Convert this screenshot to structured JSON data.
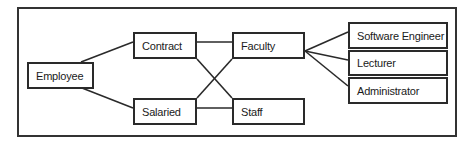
{
  "diagram": {
    "type": "hierarchy",
    "nodes": [
      {
        "id": "employee",
        "label": "Employee",
        "x": 27,
        "y": 62,
        "w": 67,
        "h": 27
      },
      {
        "id": "contract",
        "label": "Contract",
        "x": 133,
        "y": 32,
        "w": 64,
        "h": 27
      },
      {
        "id": "salaried",
        "label": "Salaried",
        "x": 133,
        "y": 98,
        "w": 64,
        "h": 27
      },
      {
        "id": "faculty",
        "label": "Faculty",
        "x": 232,
        "y": 32,
        "w": 73,
        "h": 27
      },
      {
        "id": "staff",
        "label": "Staff",
        "x": 232,
        "y": 98,
        "w": 73,
        "h": 27
      },
      {
        "id": "software_engineer",
        "label": "Software Engineer",
        "x": 348,
        "y": 22,
        "w": 100,
        "h": 27
      },
      {
        "id": "lecturer",
        "label": "Lecturer",
        "x": 348,
        "y": 50,
        "w": 100,
        "h": 26
      },
      {
        "id": "administrator",
        "label": "Administrator",
        "x": 348,
        "y": 77,
        "w": 100,
        "h": 27
      }
    ],
    "edges": [
      {
        "from": "employee",
        "to": "contract"
      },
      {
        "from": "employee",
        "to": "salaried"
      },
      {
        "from": "contract",
        "to": "faculty"
      },
      {
        "from": "contract",
        "to": "staff"
      },
      {
        "from": "salaried",
        "to": "faculty"
      },
      {
        "from": "salaried",
        "to": "staff"
      },
      {
        "from": "faculty",
        "to": "software_engineer"
      },
      {
        "from": "faculty",
        "to": "lecturer"
      },
      {
        "from": "faculty",
        "to": "administrator"
      }
    ]
  }
}
